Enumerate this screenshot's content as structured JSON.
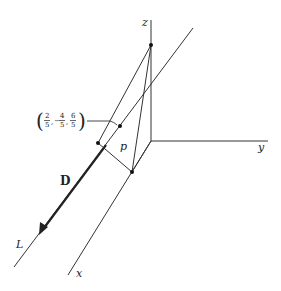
{
  "diagram": {
    "axes": {
      "x_label": "x",
      "y_label": "y",
      "z_label": "z"
    },
    "line_label": "L",
    "direction_label": "D",
    "distance_label": "p",
    "point": {
      "x_num": "2",
      "x_den": "5",
      "y_sign": "−",
      "y_num": "4",
      "y_den": "5",
      "z_num": "6",
      "z_den": "5",
      "open_paren": "(",
      "close_paren": ")",
      "comma": ","
    },
    "colors": {
      "line": "#333333",
      "background": "#ffffff"
    }
  }
}
